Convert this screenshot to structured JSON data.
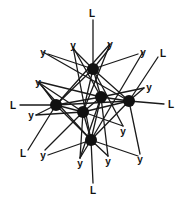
{
  "diagram": {
    "type": "network-graph",
    "colors": {
      "edge": "#1a1a1a",
      "node": "#111111",
      "background": "#ffffff"
    },
    "nodes": [
      {
        "id": "n1",
        "x": 93,
        "y": 69,
        "r": 6
      },
      {
        "id": "n2",
        "x": 56,
        "y": 105,
        "r": 6
      },
      {
        "id": "n3",
        "x": 101,
        "y": 97,
        "r": 6
      },
      {
        "id": "n4",
        "x": 129,
        "y": 101,
        "r": 6
      },
      {
        "id": "n5",
        "x": 83,
        "y": 112,
        "r": 6
      },
      {
        "id": "n6",
        "x": 91,
        "y": 140,
        "r": 6
      }
    ],
    "labels": [
      {
        "id": "l_top",
        "text": "L",
        "x": 92,
        "y": 13
      },
      {
        "id": "y_tl1",
        "text": "y",
        "x": 43,
        "y": 52
      },
      {
        "id": "y_tl2",
        "text": "y",
        "x": 73,
        "y": 45
      },
      {
        "id": "y_tr1",
        "text": "y",
        "x": 110,
        "y": 44
      },
      {
        "id": "y_tr2",
        "text": "y",
        "x": 143,
        "y": 52
      },
      {
        "id": "l_upper_right",
        "text": "L",
        "x": 163,
        "y": 53
      },
      {
        "id": "y_left_mid",
        "text": "y",
        "x": 38,
        "y": 82
      },
      {
        "id": "y_right_mid",
        "text": "y",
        "x": 149,
        "y": 87
      },
      {
        "id": "l_left",
        "text": "L",
        "x": 13,
        "y": 105
      },
      {
        "id": "l_right",
        "text": "L",
        "x": 171,
        "y": 104
      },
      {
        "id": "y_left_low",
        "text": "y",
        "x": 31,
        "y": 115
      },
      {
        "id": "y_right_low",
        "text": "y",
        "x": 123,
        "y": 131
      },
      {
        "id": "l_lower_left",
        "text": "L",
        "x": 23,
        "y": 153
      },
      {
        "id": "y_bl",
        "text": "y",
        "x": 43,
        "y": 155
      },
      {
        "id": "y_b1",
        "text": "y",
        "x": 80,
        "y": 163
      },
      {
        "id": "y_b2",
        "text": "y",
        "x": 108,
        "y": 161
      },
      {
        "id": "y_br",
        "text": "y",
        "x": 140,
        "y": 159
      },
      {
        "id": "l_bottom",
        "text": "L",
        "x": 93,
        "y": 190
      }
    ],
    "edges": [
      [
        93,
        69,
        93,
        20
      ],
      [
        93,
        69,
        48,
        54
      ],
      [
        93,
        69,
        74,
        50
      ],
      [
        93,
        69,
        109,
        49
      ],
      [
        93,
        69,
        138,
        54
      ],
      [
        93,
        69,
        56,
        105
      ],
      [
        93,
        69,
        101,
        97
      ],
      [
        93,
        69,
        129,
        101
      ],
      [
        93,
        69,
        83,
        112
      ],
      [
        93,
        69,
        123,
        126
      ],
      [
        56,
        105,
        20,
        105
      ],
      [
        56,
        105,
        36,
        115
      ],
      [
        56,
        105,
        42,
        86
      ],
      [
        56,
        105,
        101,
        97
      ],
      [
        56,
        105,
        129,
        101
      ],
      [
        56,
        105,
        83,
        112
      ],
      [
        56,
        105,
        91,
        140
      ],
      [
        56,
        105,
        110,
        44
      ],
      [
        56,
        105,
        28,
        150
      ],
      [
        101,
        97,
        40,
        82
      ],
      [
        101,
        97,
        144,
        88
      ],
      [
        101,
        97,
        129,
        101
      ],
      [
        101,
        97,
        83,
        112
      ],
      [
        101,
        97,
        91,
        140
      ],
      [
        101,
        97,
        80,
        158
      ],
      [
        101,
        97,
        108,
        156
      ],
      [
        101,
        97,
        73,
        47
      ],
      [
        129,
        101,
        164,
        104
      ],
      [
        129,
        101,
        158,
        57
      ],
      [
        129,
        101,
        144,
        88
      ],
      [
        129,
        101,
        83,
        112
      ],
      [
        129,
        101,
        91,
        140
      ],
      [
        129,
        101,
        140,
        154
      ],
      [
        129,
        101,
        43,
        52
      ],
      [
        83,
        112,
        36,
        115
      ],
      [
        83,
        112,
        91,
        140
      ],
      [
        83,
        112,
        45,
        150
      ],
      [
        83,
        112,
        123,
        126
      ],
      [
        83,
        112,
        110,
        44
      ],
      [
        83,
        112,
        80,
        158
      ],
      [
        83,
        112,
        38,
        82
      ],
      [
        91,
        140,
        93,
        183
      ],
      [
        91,
        140,
        80,
        158
      ],
      [
        91,
        140,
        108,
        156
      ],
      [
        91,
        140,
        138,
        156
      ],
      [
        91,
        140,
        48,
        155
      ],
      [
        91,
        140,
        73,
        47
      ],
      [
        91,
        140,
        38,
        82
      ],
      [
        91,
        140,
        143,
        52
      ]
    ]
  }
}
